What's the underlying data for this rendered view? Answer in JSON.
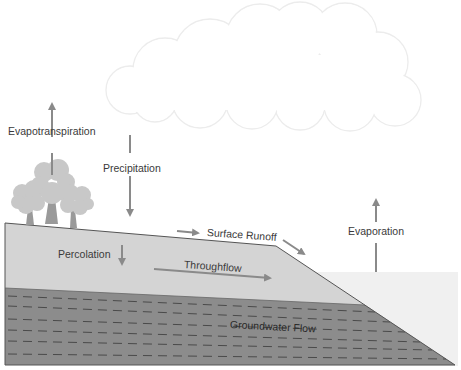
{
  "diagram": {
    "labels": {
      "evapotranspiration": "Evapotranspiration",
      "precipitation": "Precipitation",
      "surface_runoff": "Surface Runoff",
      "evaporation": "Evaporation",
      "percolation": "Percolation",
      "throughflow": "Throughflow",
      "groundwater_flow": "Groundwater Flow"
    },
    "colors": {
      "topsoil": "#d4d4d4",
      "groundwater": "#8c8c8c",
      "water_body": "#f0f0f0",
      "arrow": "#8a8a8a",
      "tree_canopy": "#c8c8c8",
      "tree_trunk": "#9a9a9a",
      "cloud_outline": "#ececec",
      "outline": "#555555"
    }
  }
}
